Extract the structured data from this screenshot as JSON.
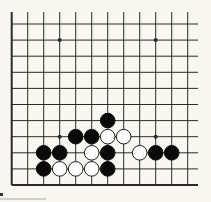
{
  "diagram": {
    "type": "go-board-partial",
    "grid": {
      "columns": 12,
      "rows": 11,
      "origin_x": 11.7,
      "origin_y": 24,
      "spacing_x": 16,
      "spacing_y": 16.1,
      "top_open_y": 12,
      "right_open_x": 198,
      "left_edge": true,
      "bottom_edge": true
    },
    "colors": {
      "background": "#f8f7f2",
      "line": "#2a2a2a",
      "black_stone": "#0a0a0a",
      "white_stone": "#ffffff",
      "white_stone_outline": "#1a1a1a"
    },
    "star_points": [
      {
        "col": 3,
        "row": 1
      },
      {
        "col": 9,
        "row": 1
      },
      {
        "col": 3,
        "row": 7
      },
      {
        "col": 9,
        "row": 7
      }
    ],
    "stones": [
      {
        "color": "black",
        "col": 6,
        "row": 6
      },
      {
        "color": "black",
        "col": 4,
        "row": 7
      },
      {
        "color": "black",
        "col": 5,
        "row": 7
      },
      {
        "color": "white",
        "col": 6,
        "row": 7
      },
      {
        "color": "white",
        "col": 7,
        "row": 7
      },
      {
        "color": "black",
        "col": 2,
        "row": 8
      },
      {
        "color": "black",
        "col": 3,
        "row": 8
      },
      {
        "color": "white",
        "col": 5,
        "row": 8
      },
      {
        "color": "black",
        "col": 6,
        "row": 8
      },
      {
        "color": "white",
        "col": 8,
        "row": 8
      },
      {
        "color": "black",
        "col": 9,
        "row": 8
      },
      {
        "color": "black",
        "col": 10,
        "row": 8
      },
      {
        "color": "black",
        "col": 2,
        "row": 9
      },
      {
        "color": "white",
        "col": 3,
        "row": 9
      },
      {
        "color": "white",
        "col": 4,
        "row": 9
      },
      {
        "color": "white",
        "col": 5,
        "row": 9
      },
      {
        "color": "black",
        "col": 6,
        "row": 9
      }
    ]
  }
}
